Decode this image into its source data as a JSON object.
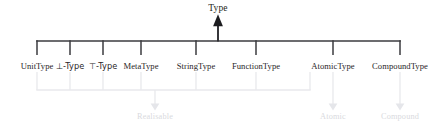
{
  "diagram": {
    "background_color": "#ffffff",
    "edge_color": "#3b3b3f",
    "group_edge_color": "#e6e7ea",
    "label_color": "#2a2627",
    "group_label_color": "#d9dade",
    "root": {
      "label": "Type",
      "x": 218,
      "arrow": "up-arrow"
    },
    "types": [
      {
        "id": "unit-type",
        "label": "UnitType",
        "x": 37,
        "in_realisable": true
      },
      {
        "id": "bottom-type",
        "label": "⊥-Type",
        "x": 70,
        "in_realisable": true
      },
      {
        "id": "top-type",
        "label": "⊤-Type",
        "x": 103,
        "in_realisable": true
      },
      {
        "id": "meta-type",
        "label": "MetaType",
        "x": 141,
        "in_realisable": true
      },
      {
        "id": "string-type",
        "label": "StringType",
        "x": 196,
        "in_realisable": true
      },
      {
        "id": "function-type",
        "label": "FunctionType",
        "x": 256,
        "in_realisable": true
      },
      {
        "id": "atomic-type",
        "label": "AtomicType",
        "x": 333,
        "in_realisable": false
      },
      {
        "id": "compound-type",
        "label": "CompoundType",
        "x": 400,
        "in_realisable": false
      }
    ],
    "groups": [
      {
        "id": "realisable",
        "label": "Realisable",
        "x": 155,
        "y": 118
      },
      {
        "id": "atomic",
        "label": "Atomic",
        "x": 333,
        "y": 118
      },
      {
        "id": "compound",
        "label": "Compound",
        "x": 400,
        "y": 118
      }
    ]
  }
}
